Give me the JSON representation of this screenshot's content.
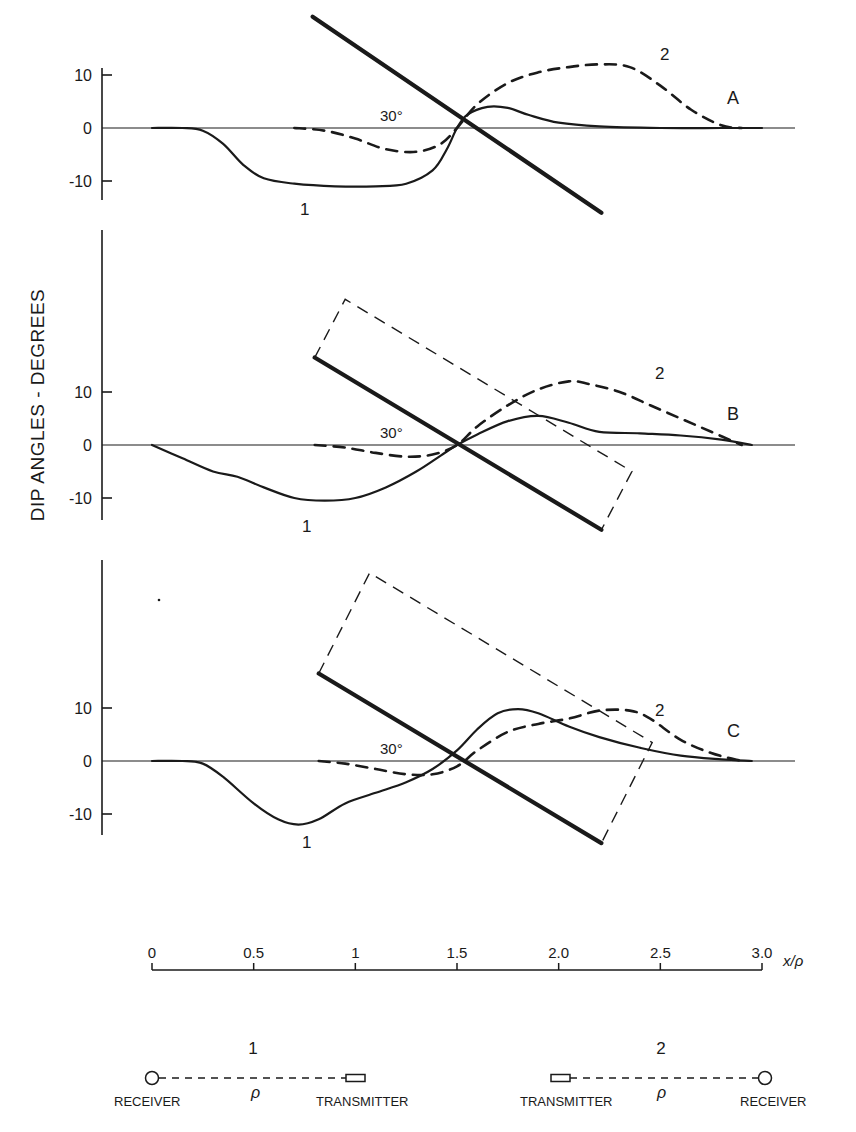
{
  "figure": {
    "ylabel": "DIP ANGLES - DEGREES",
    "xlabel": "x/ρ",
    "ink_color": "#1a1a1a",
    "background": "#ffffff"
  },
  "axis": {
    "x_ticks": [
      {
        "v": 0,
        "label": "0"
      },
      {
        "v": 0.5,
        "label": "0.5"
      },
      {
        "v": 1.0,
        "label": "1"
      },
      {
        "v": 1.5,
        "label": "1.5"
      },
      {
        "v": 2.0,
        "label": "2.0"
      },
      {
        "v": 2.5,
        "label": "2.5"
      },
      {
        "v": 3.0,
        "label": "3.0"
      }
    ],
    "y_ticks": [
      {
        "v": 10,
        "label": "10"
      },
      {
        "v": 0,
        "label": "0"
      },
      {
        "v": -10,
        "label": "-10"
      }
    ]
  },
  "legend": {
    "config1": {
      "number": "1",
      "left": "RECEIVER",
      "right": "TRANSMITTER",
      "spacing": "ρ"
    },
    "config2": {
      "number": "2",
      "left": "TRANSMITTER",
      "right": "RECEIVER",
      "spacing": "ρ"
    }
  },
  "chart_data": [
    {
      "type": "line",
      "panel": "A",
      "title": "A",
      "xlabel": "x/ρ",
      "ylabel": "DIP ANGLES - DEGREES",
      "xlim": [
        0,
        3.0
      ],
      "ylim": [
        -10,
        10
      ],
      "dip_annotation": "30°",
      "conductor": {
        "x1": 0.79,
        "y1": 21,
        "x2": 2.21,
        "y2": -16,
        "dashed_box": null
      },
      "series": [
        {
          "name": "1",
          "style": "solid",
          "x": [
            0,
            0.15,
            0.25,
            0.35,
            0.45,
            0.55,
            0.7,
            0.9,
            1.1,
            1.25,
            1.38,
            1.45,
            1.5,
            1.55,
            1.65,
            1.75,
            1.85,
            2.0,
            2.2,
            2.5,
            2.8,
            3.0
          ],
          "y": [
            0,
            0,
            -0.5,
            -3,
            -7,
            -9.5,
            -10.5,
            -11,
            -11,
            -10.5,
            -8,
            -4,
            0,
            2.5,
            4,
            3.8,
            2.5,
            1,
            0.3,
            0,
            0,
            0
          ]
        },
        {
          "name": "2",
          "style": "dashed",
          "x": [
            0.7,
            0.85,
            1.0,
            1.15,
            1.3,
            1.42,
            1.5,
            1.6,
            1.75,
            1.9,
            2.05,
            2.2,
            2.35,
            2.5,
            2.65,
            2.8,
            2.9
          ],
          "y": [
            0,
            -0.5,
            -2,
            -4,
            -4.5,
            -3,
            0,
            4.5,
            8.5,
            10.5,
            11.5,
            12,
            11.5,
            8,
            3.5,
            0.5,
            0
          ]
        }
      ]
    },
    {
      "type": "line",
      "panel": "B",
      "title": "B",
      "xlabel": "x/ρ",
      "ylabel": "DIP ANGLES - DEGREES",
      "xlim": [
        0,
        3.0
      ],
      "ylim": [
        -10,
        10
      ],
      "dip_annotation": "30°",
      "conductor": {
        "x1": 0.8,
        "y1": 16.5,
        "x2": 2.21,
        "y2": -16,
        "dashed_box": [
          [
            0.8,
            16.5
          ],
          [
            0.95,
            27.5
          ],
          [
            2.36,
            -5
          ],
          [
            2.21,
            -16
          ]
        ]
      },
      "series": [
        {
          "name": "1",
          "style": "solid",
          "x": [
            0,
            0.15,
            0.3,
            0.42,
            0.55,
            0.7,
            0.85,
            1.0,
            1.15,
            1.3,
            1.42,
            1.5,
            1.6,
            1.75,
            1.9,
            2.05,
            2.2,
            2.4,
            2.6,
            2.8,
            2.95
          ],
          "y": [
            0,
            -2.5,
            -5,
            -6,
            -8,
            -10,
            -10.5,
            -10,
            -8,
            -5,
            -2,
            0,
            2,
            4.5,
            5.5,
            4.2,
            2.5,
            2.2,
            1.8,
            1,
            0
          ]
        },
        {
          "name": "2",
          "style": "dashed",
          "x": [
            0.8,
            0.95,
            1.1,
            1.25,
            1.38,
            1.5,
            1.6,
            1.75,
            1.9,
            2.05,
            2.15,
            2.3,
            2.45,
            2.6,
            2.75,
            2.9
          ],
          "y": [
            0,
            -0.5,
            -1.5,
            -2.2,
            -1.8,
            0,
            3.5,
            7.5,
            10.5,
            12,
            11.5,
            10,
            7.5,
            5,
            2.5,
            0
          ]
        }
      ]
    },
    {
      "type": "line",
      "panel": "C",
      "title": "C",
      "xlabel": "x/ρ",
      "ylabel": "DIP ANGLES - DEGREES",
      "xlim": [
        0,
        3.0
      ],
      "ylim": [
        -10,
        10
      ],
      "dip_annotation": "30°",
      "conductor": {
        "x1": 0.82,
        "y1": 16.5,
        "x2": 2.21,
        "y2": -15.5,
        "dashed_box": [
          [
            0.82,
            16.5
          ],
          [
            1.07,
            35.5
          ],
          [
            2.46,
            3.5
          ],
          [
            2.21,
            -15.5
          ]
        ]
      },
      "series": [
        {
          "name": "1",
          "style": "solid",
          "x": [
            0,
            0.15,
            0.25,
            0.35,
            0.5,
            0.62,
            0.72,
            0.82,
            0.95,
            1.1,
            1.25,
            1.38,
            1.5,
            1.6,
            1.7,
            1.8,
            1.9,
            2.05,
            2.2,
            2.4,
            2.6,
            2.8,
            2.95
          ],
          "y": [
            0,
            0,
            -0.5,
            -3,
            -8,
            -11,
            -12,
            -11,
            -8,
            -6,
            -4,
            -1.5,
            2,
            6,
            9,
            9.8,
            9,
            6.5,
            4.5,
            2.5,
            1,
            0.3,
            0
          ]
        },
        {
          "name": "2",
          "style": "dashed",
          "x": [
            0.82,
            0.95,
            1.1,
            1.25,
            1.38,
            1.5,
            1.6,
            1.75,
            1.9,
            2.05,
            2.2,
            2.35,
            2.45,
            2.6,
            2.75,
            2.9
          ],
          "y": [
            0,
            -0.5,
            -1.5,
            -2.5,
            -2.5,
            -1,
            2,
            5.5,
            7,
            8,
            9.5,
            9.5,
            8,
            4,
            1.5,
            0
          ]
        }
      ]
    }
  ]
}
